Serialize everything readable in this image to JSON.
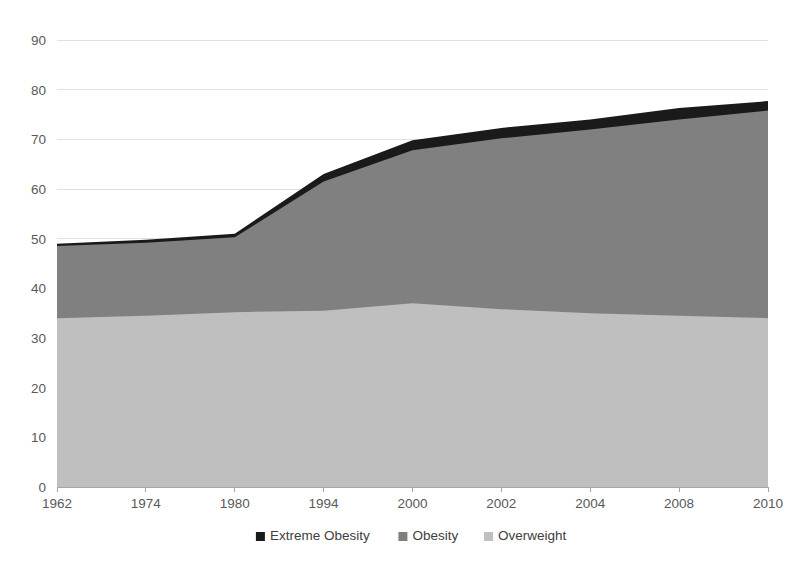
{
  "chart_data": {
    "type": "area",
    "stacked": true,
    "title": "",
    "subtitle": "",
    "xlabel": "",
    "ylabel": "",
    "categories": [
      "1962",
      "1974",
      "1980",
      "1994",
      "2000",
      "2002",
      "2004",
      "2008",
      "2010"
    ],
    "ylim": [
      0,
      90
    ],
    "ytick_values": [
      0,
      10,
      20,
      30,
      40,
      50,
      60,
      70,
      80,
      90
    ],
    "ytick_labels": [
      "0",
      "10",
      "20",
      "30",
      "40",
      "50",
      "60",
      "70",
      "80",
      "90"
    ],
    "grid": true,
    "grid_axis": "y",
    "legend_position": "bottom",
    "series": [
      {
        "name": "Overweight",
        "color": "#bfbfbf",
        "stack_order": 1,
        "values": [
          34.0,
          34.5,
          35.2,
          35.5,
          37.0,
          35.8,
          35.0,
          34.5,
          34.0
        ]
      },
      {
        "name": "Obesity",
        "color": "#808080",
        "stack_order": 2,
        "values": [
          14.5,
          14.7,
          15.1,
          26.0,
          30.8,
          34.4,
          37.0,
          39.5,
          41.8
        ]
      },
      {
        "name": "Extreme Obesity",
        "color": "#1a1a1a",
        "stack_order": 3,
        "values": [
          0.5,
          0.6,
          0.7,
          1.5,
          2.0,
          2.1,
          2.0,
          2.3,
          1.9
        ]
      }
    ],
    "cumulative_tops": {
      "Overweight": [
        34.0,
        34.5,
        35.2,
        35.5,
        37.0,
        35.8,
        35.0,
        34.5,
        34.0
      ],
      "Obesity": [
        48.5,
        49.2,
        50.3,
        61.5,
        67.8,
        70.2,
        72.0,
        74.0,
        75.8
      ],
      "Extreme Obesity": [
        49.0,
        49.8,
        51.0,
        63.0,
        69.8,
        72.3,
        74.0,
        76.3,
        77.7
      ]
    }
  },
  "legend": {
    "items": [
      {
        "label": "Extreme Obesity",
        "color": "#1a1a1a"
      },
      {
        "label": "Obesity",
        "color": "#808080"
      },
      {
        "label": "Overweight",
        "color": "#bfbfbf"
      }
    ]
  },
  "colors": {
    "extreme_obesity": "#1a1a1a",
    "obesity": "#808080",
    "overweight": "#bfbfbf",
    "gridline": "#d9d9d9",
    "axis": "#a6a6a6",
    "tick_label": "#595959",
    "background": "#ffffff"
  }
}
